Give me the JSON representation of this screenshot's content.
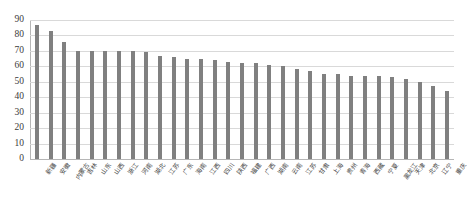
{
  "chart_data": {
    "type": "bar",
    "title": "",
    "subtitle": "",
    "xlabel": "",
    "ylabel": "",
    "ylim": [
      0,
      90
    ],
    "ytick_step": 10,
    "yticks": [
      0,
      10,
      20,
      30,
      40,
      50,
      60,
      70,
      80,
      90
    ],
    "grid": true,
    "legend": false,
    "legend_position": "none",
    "bar_color": "#808080",
    "gridline_color": "#D9D9D9",
    "axis_color": "#B6B6B6",
    "categories": [
      "新疆",
      "安徽",
      "内蒙古",
      "吉林",
      "山东",
      "山西",
      "浙江",
      "河南",
      "湖北",
      "江苏",
      "广东",
      "海南",
      "江西",
      "四川",
      "陕西",
      "福建",
      "广西",
      "湖南",
      "云南",
      "江苏",
      "甘肃",
      "上海",
      "贵州",
      "青海",
      "西藏",
      "宁夏",
      "黑龙江",
      "天津",
      "北京",
      "辽宁",
      "重庆"
    ],
    "values": [
      87,
      83,
      76,
      70,
      70,
      70,
      70,
      70,
      69,
      67,
      66,
      65,
      65,
      64,
      63,
      62,
      62,
      61,
      60,
      58,
      57,
      55,
      55,
      54,
      54,
      54,
      53,
      52,
      50,
      47,
      44
    ],
    "series": [
      {
        "name": "",
        "values": [
          87,
          83,
          76,
          70,
          70,
          70,
          70,
          70,
          69,
          67,
          66,
          65,
          65,
          64,
          63,
          62,
          62,
          61,
          60,
          58,
          57,
          55,
          55,
          54,
          54,
          54,
          53,
          52,
          50,
          47,
          44
        ]
      }
    ]
  }
}
